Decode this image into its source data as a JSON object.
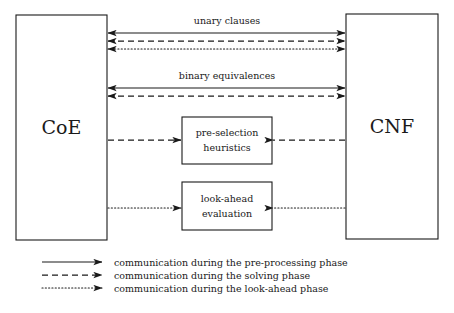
{
  "figure": {
    "type": "block-diagram",
    "title": "",
    "background_color": "#ffffff",
    "line_color": "#1a1a1a"
  },
  "nodes": {
    "coe": {
      "label": "CoE",
      "x": 16,
      "y": 15,
      "width": 91,
      "height": 225
    },
    "cnf": {
      "label": "CNF",
      "x": 346,
      "y": 14,
      "width": 92,
      "height": 225
    },
    "preselection": {
      "line1": "pre-selection",
      "line2": "heuristics",
      "x": 182,
      "y": 117,
      "width": 90,
      "height": 47
    },
    "lookahead": {
      "line1": "look-ahead",
      "line2": "evaluation",
      "x": 182,
      "y": 182,
      "width": 90,
      "height": 48
    }
  },
  "edge_labels": {
    "unary": "unary clauses",
    "binary": "binary equivalences"
  },
  "legend": {
    "items": [
      {
        "style": "solid",
        "label": "communication during the pre-processing phase"
      },
      {
        "style": "dashed",
        "label": "communication during the solving phase"
      },
      {
        "style": "dotted",
        "label": "communication during the look-ahead phase"
      }
    ]
  },
  "connections": [
    {
      "name": "unary-preprocessing",
      "style": "solid",
      "from": "coe",
      "to": "cnf",
      "direction": "both",
      "y": 33
    },
    {
      "name": "unary-solving",
      "style": "dashed",
      "from": "coe",
      "to": "cnf",
      "direction": "both",
      "y": 41
    },
    {
      "name": "unary-lookahead",
      "style": "dotted",
      "from": "coe",
      "to": "cnf",
      "direction": "both",
      "y": 49
    },
    {
      "name": "binary-preprocessing",
      "style": "solid",
      "from": "coe",
      "to": "cnf",
      "direction": "both",
      "y": 88
    },
    {
      "name": "binary-solving",
      "style": "dashed",
      "from": "coe",
      "to": "cnf",
      "direction": "both",
      "y": 96
    },
    {
      "name": "coe-to-preselection",
      "style": "dashed",
      "from": "coe",
      "to": "preselection",
      "direction": "right",
      "y": 140
    },
    {
      "name": "cnf-to-preselection",
      "style": "dashed",
      "from": "cnf",
      "to": "preselection",
      "direction": "left",
      "y": 140
    },
    {
      "name": "coe-to-lookahead",
      "style": "dotted",
      "from": "coe",
      "to": "lookahead",
      "direction": "right",
      "y": 208
    },
    {
      "name": "cnf-to-lookahead",
      "style": "dotted",
      "from": "cnf",
      "to": "lookahead",
      "direction": "left",
      "y": 208
    }
  ]
}
